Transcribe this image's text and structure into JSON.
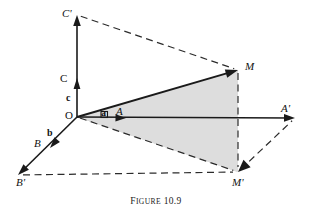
{
  "figure": {
    "caption_word": "F",
    "caption_word_rest": "IGURE",
    "caption_number": "10.9",
    "caption_full": "FIGURE 10.9",
    "background_color": "#ffffff",
    "ink_color": "#1a1a1a",
    "shade_color": "#dcdcdc",
    "width": 312,
    "height": 220
  },
  "labels": {
    "origin": "O",
    "vector_a": "a",
    "vector_b": "b",
    "vector_c": "c",
    "point_A": "A",
    "point_B": "B",
    "point_C": "C",
    "point_A_prime": "A'",
    "point_B_prime": "B'",
    "point_C_prime": "C'",
    "point_M": "M",
    "point_M_prime": "M'"
  },
  "chart_data": {
    "type": "diagram",
    "title": "FIGURE 10.9",
    "points": {
      "O": [
        77,
        117
      ],
      "A": [
        126,
        118
      ],
      "B": [
        50,
        148
      ],
      "C": [
        77,
        78
      ],
      "Aprime": [
        295,
        118
      ],
      "Bprime": [
        18,
        175
      ],
      "Cprime": [
        77,
        15
      ],
      "M": [
        238,
        70
      ],
      "Mprime": [
        238,
        172
      ]
    },
    "solid_segments": [
      {
        "name": "axis-c-to-Cprime",
        "from": "O",
        "to": "Cprime"
      },
      {
        "name": "axis-a-to-Aprime",
        "from": "O",
        "to": "Aprime"
      },
      {
        "name": "axis-b-to-Bprime",
        "from": "O",
        "to": "Bprime"
      },
      {
        "name": "vector-OM",
        "from": "O",
        "to": "M"
      }
    ],
    "dashed_segments": [
      {
        "name": "Cprime-to-M",
        "from": "Cprime",
        "to": "M"
      },
      {
        "name": "M-to-Mprime",
        "from": "M",
        "to": "Mprime"
      },
      {
        "name": "O-to-Mprime",
        "from": "O",
        "to": "Mprime"
      },
      {
        "name": "Bprime-to-Mprime",
        "from": "Bprime",
        "to": "Mprime"
      },
      {
        "name": "Mprime-to-Aprime",
        "from": "Mprime",
        "to": "Aprime"
      }
    ],
    "shaded_polygon": [
      "O",
      "M",
      "Mprime"
    ],
    "arrow_tips": [
      "Cprime",
      "C",
      "Aprime",
      "A",
      "Bprime",
      "B",
      "M",
      "Mprime"
    ],
    "right_angle_at": "O"
  }
}
